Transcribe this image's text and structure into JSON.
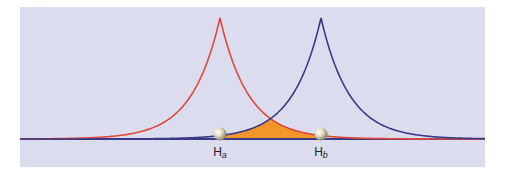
{
  "diagram": {
    "colors": {
      "background": "#dcdcef",
      "curve_a": "#e0483a",
      "curve_b": "#3b3a86",
      "overlap_fill": "#f2952a",
      "nucleus": "#d9d4b8"
    },
    "panel": {
      "x": 20,
      "y": 7,
      "width": 465,
      "height": 160
    },
    "baseline_y": 139,
    "peak_height": 121,
    "decay_per_px": 0.0353,
    "nuclei": [
      {
        "id": "a",
        "x": 220,
        "label": "H",
        "sub": "a"
      },
      {
        "id": "b",
        "x": 321,
        "label": "H",
        "sub": "b"
      }
    ],
    "overlap_region_label": "orbital overlap"
  }
}
